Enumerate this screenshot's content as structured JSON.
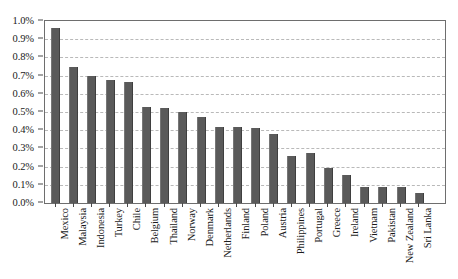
{
  "chart_data": {
    "type": "bar",
    "title": "",
    "subtitle": "",
    "xlabel": "",
    "ylabel": "",
    "ylim": [
      0,
      1.0
    ],
    "ytick_labels": [
      "1.0%",
      "0.9%",
      "0.8%",
      "0.7%",
      "0.6%",
      "0.5%",
      "0.4%",
      "0.3%",
      "0.2%",
      "0.1%",
      "0.0%"
    ],
    "ytick_values": [
      1.0,
      0.9,
      0.8,
      0.7,
      0.6,
      0.5,
      0.4,
      0.3,
      0.2,
      0.1,
      0.0
    ],
    "y_unit": "%",
    "grid": true,
    "grid_style": "dashed-horizontal",
    "legend": false,
    "legend_position": "none",
    "bar_color": "#5a5a5a",
    "grid_color": "#b9b9b9",
    "frame_color": "#6e6e6e",
    "background_color": "#ffffff",
    "categories": [
      "Mexico",
      "Malaysia",
      "Indonesia",
      "Turkey",
      "Chile",
      "Belgium",
      "Thailand",
      "Norway",
      "Denmark",
      "Netherlands",
      "Finland",
      "Poland",
      "Austria",
      "Philippines",
      "Portugal",
      "Greece",
      "Ireland",
      "Vietnam",
      "Pakistan",
      "New Zealand",
      "Sri Lanka"
    ],
    "values": [
      0.96,
      0.75,
      0.7,
      0.675,
      0.665,
      0.525,
      0.52,
      0.5,
      0.475,
      0.42,
      0.42,
      0.41,
      0.38,
      0.26,
      0.275,
      0.19,
      0.155,
      0.09,
      0.09,
      0.09,
      0.055
    ]
  }
}
